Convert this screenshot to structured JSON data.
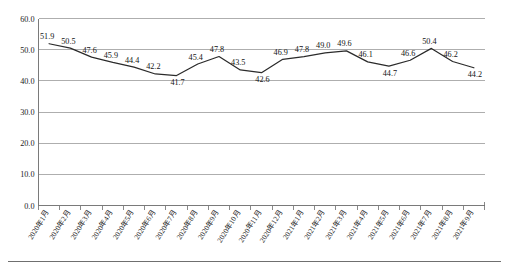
{
  "chart_data": {
    "type": "line",
    "title": "",
    "xlabel": "",
    "ylabel": "",
    "ylim": [
      0.0,
      60.0
    ],
    "grid": true,
    "legend": false,
    "y_ticks": [
      "0.0",
      "10.0",
      "20.0",
      "30.0",
      "40.0",
      "50.0",
      "60.0"
    ],
    "y_tick_values": [
      0.0,
      10.0,
      20.0,
      30.0,
      40.0,
      50.0,
      60.0
    ],
    "categories": [
      "2020年1月",
      "2020年2月",
      "2020年3月",
      "2020年4月",
      "2020年5月",
      "2020年6月",
      "2020年7月",
      "2020年8月",
      "2020年9月",
      "2020年10月",
      "2020年11月",
      "2020年12月",
      "2021年1月",
      "2021年2月",
      "2021年3月",
      "2021年4月",
      "2021年5月",
      "2021年6月",
      "2021年7月",
      "2021年8月",
      "2021年9月"
    ],
    "values": [
      51.9,
      50.5,
      47.6,
      45.9,
      44.4,
      42.2,
      41.7,
      45.4,
      47.8,
      43.5,
      42.6,
      46.9,
      47.8,
      49.0,
      49.6,
      46.1,
      44.7,
      46.6,
      50.4,
      46.2,
      44.2
    ],
    "point_labels": [
      "51.9",
      "50.5",
      "47.6",
      "45.9",
      "44.4",
      "42.2",
      "41.7",
      "45.4",
      "47.8",
      "43.5",
      "42.6",
      "46.9",
      "47.8",
      "49.0",
      "49.6",
      "46.1",
      "44.7",
      "46.6",
      "50.4",
      "46.2",
      "44.2"
    ],
    "series": [
      {
        "name": "",
        "color": "#2b2b2b",
        "values": [
          51.9,
          50.5,
          47.6,
          45.9,
          44.4,
          42.2,
          41.7,
          45.4,
          47.8,
          43.5,
          42.6,
          46.9,
          47.8,
          49.0,
          49.6,
          46.1,
          44.7,
          46.6,
          50.4,
          46.2,
          44.2
        ]
      }
    ]
  },
  "caption": {
    "text": ""
  },
  "colors": {
    "line": "#2b2b2b",
    "grid": "#9a9a9a",
    "axis": "#6b6b6b",
    "text": "#1a1a1a",
    "background": "#ffffff"
  }
}
